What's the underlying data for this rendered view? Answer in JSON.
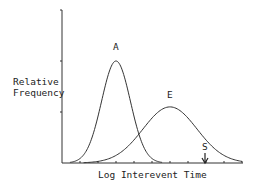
{
  "chart_data": {
    "type": "line",
    "title": "",
    "xlabel": "Log Interevent Time",
    "ylabel": "Relative Frequency",
    "grid": false,
    "legend": "none (curves labeled inline)",
    "x_ticks": 10,
    "y_ticks": 2,
    "series": [
      {
        "name": "A",
        "shape": "normal",
        "peak_x": 3.0,
        "peak_y": 1.0,
        "sd": 0.8
      },
      {
        "name": "E",
        "shape": "normal",
        "peak_x": 6.0,
        "peak_y": 0.55,
        "sd": 1.5
      }
    ],
    "annotations": [
      {
        "label": "A",
        "position": "above peak of first curve"
      },
      {
        "label": "E",
        "position": "above peak of second curve"
      },
      {
        "label": "S",
        "position": "arrow pointing down to x-axis near x=8.0"
      }
    ],
    "xlim": [
      0,
      10
    ],
    "ylim": [
      0,
      1.5
    ]
  },
  "labels": {
    "ylabel_line1": "Relative",
    "ylabel_line2": "Frequency",
    "xlabel": "Log Interevent Time",
    "curve_a": "A",
    "curve_e": "E",
    "marker_s": "S"
  }
}
